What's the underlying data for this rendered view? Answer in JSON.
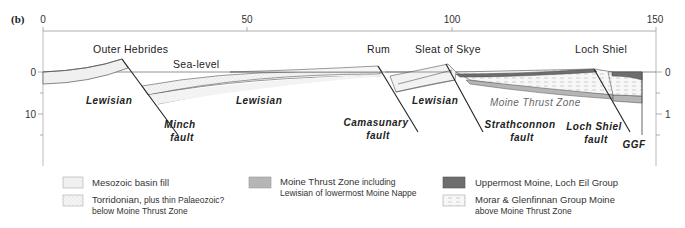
{
  "figure": {
    "panel_label": "(b)",
    "x_axis": {
      "ticks": [
        {
          "label": "0",
          "value": 0
        },
        {
          "label": "50",
          "value": 50
        },
        {
          "label": "100",
          "value": 100
        },
        {
          "label": "150",
          "value": 150
        }
      ]
    },
    "left_axis": {
      "ticks": [
        {
          "label": "0",
          "value": 0
        },
        {
          "label": "10",
          "value": 10
        }
      ]
    },
    "right_axis": {
      "ticks": [
        {
          "label": "0",
          "value": 0
        },
        {
          "label": "1",
          "value": 1
        }
      ]
    },
    "places": [
      {
        "label": "Outer Hebrides"
      },
      {
        "label": "Rum"
      },
      {
        "label": "Sleat of Skye"
      },
      {
        "label": "Loch Shiel"
      }
    ],
    "sea_level_label": "Sea-level",
    "rock_labels": [
      {
        "label": "Lewisian"
      },
      {
        "label": "Lewisian"
      },
      {
        "label": "Lewisian"
      }
    ],
    "faults": [
      {
        "line1": "Minch",
        "line2": "fault"
      },
      {
        "line1": "Camasunary",
        "line2": "fault"
      },
      {
        "line1": "Strathconnon",
        "line2": "fault"
      },
      {
        "line1": "Loch Shiel",
        "line2": "fault"
      },
      {
        "line1": "GGF",
        "line2": ""
      }
    ],
    "moine_thrust_label": "Moine Thrust Zone",
    "colors": {
      "mesozoic": "#f2f2f2",
      "torridonian": "#f4f4f4",
      "moine_thrust": "#b5b5b5",
      "uppermost_moine": "#6e6e6e",
      "morar": "#f6f6f6",
      "line": "#333333",
      "axis": "#999999"
    }
  },
  "legend": {
    "items": [
      {
        "main": "Mesozoic basin fill",
        "small": "",
        "line2": ""
      },
      {
        "main": "Torridonian,",
        "small": " plus thin Palaeozoic?",
        "line2": "below Moine Thrust Zone"
      },
      {
        "main": "Moine Thrust Zone",
        "small": " including",
        "line2": "Lewisian of lowermost Moine Nappe"
      },
      {
        "main": "Uppermost Moine, Loch Eil Group",
        "small": "",
        "line2": ""
      },
      {
        "main": "Morar & Glenfinnan Group Moine",
        "small": "",
        "line2": "above Moine Thrust Zone"
      }
    ]
  }
}
